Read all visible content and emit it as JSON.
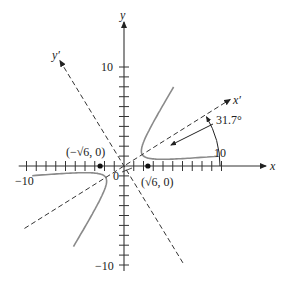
{
  "diagram": {
    "type": "rotated-hyperbola",
    "axes": {
      "x_label": "x",
      "y_label": "y",
      "x_prime_label": "x′",
      "y_prime_label": "y′",
      "x_range": [
        -10,
        10
      ],
      "y_range": [
        -10,
        10
      ],
      "tick_step": 1,
      "x_tick_labels": [
        {
          "value": -10,
          "text": "−10"
        },
        {
          "value": 10,
          "text": "10"
        }
      ],
      "y_tick_labels": [
        {
          "value": 10,
          "text": "10"
        },
        {
          "value": -10,
          "text": "−10"
        }
      ],
      "origin_label": "0"
    },
    "rotation_angle_deg": 31.7,
    "angle_label": "31.7°",
    "points": [
      {
        "x": -2.449,
        "y": 0,
        "label": "(−√6, 0)"
      },
      {
        "x": 2.449,
        "y": 0,
        "label": "(√6, 0)"
      }
    ],
    "hyperbola": {
      "description": "Hyperbola with transverse axis along x′; vertices near (±√6, 0) in xy-plane",
      "a_rotated": 2.2,
      "b_rotated": 1.1
    },
    "colors": {
      "axis": "#333333",
      "curve": "#8a8a8a",
      "dashed": "#333333",
      "point": "#111111"
    }
  }
}
